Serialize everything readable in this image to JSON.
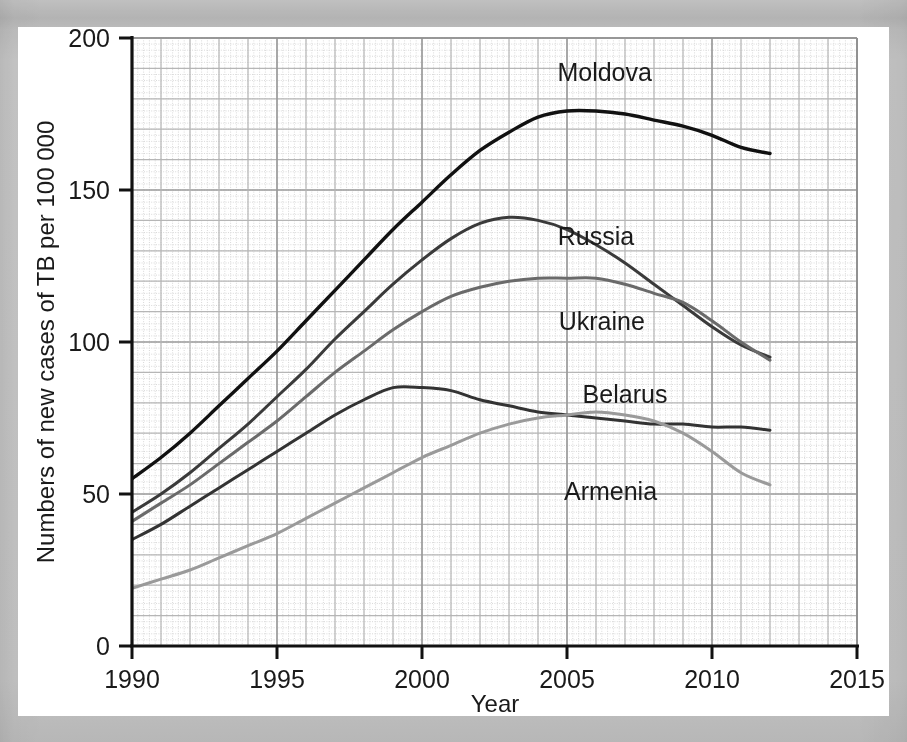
{
  "chart_data": {
    "type": "line",
    "title": "",
    "xlabel": "Year",
    "ylabel": "Numbers of new cases of TB per 100 000",
    "xlim": [
      1990,
      2015
    ],
    "ylim": [
      0,
      200
    ],
    "xticks": [
      1990,
      1995,
      2000,
      2005,
      2010,
      2015
    ],
    "xtick_labels": [
      "1990",
      "1995",
      "2000",
      "2005",
      "2010",
      "2015"
    ],
    "yticks": [
      0,
      50,
      100,
      150,
      200
    ],
    "ytick_labels": [
      "0",
      "50",
      "100",
      "150",
      "200"
    ],
    "grid": true,
    "grid_major_step_x": 1,
    "grid_major_step_y": 10,
    "grid_minor_step_x": 0.2,
    "grid_minor_step_y": 2,
    "legend": "inline-labels",
    "x": [
      1990,
      1991,
      1992,
      1993,
      1994,
      1995,
      1996,
      1997,
      1998,
      1999,
      2000,
      2001,
      2002,
      2003,
      2004,
      2005,
      2006,
      2007,
      2008,
      2009,
      2010,
      2011,
      2012
    ],
    "series": [
      {
        "name": "Moldova",
        "color": "#111111",
        "width": 3.4,
        "label_x": 2006.3,
        "label_y": 186,
        "values": [
          55,
          62,
          70,
          79,
          88,
          97,
          107,
          117,
          127,
          137,
          146,
          155,
          163,
          169,
          174,
          176,
          176,
          175,
          173,
          171,
          168,
          164,
          162
        ]
      },
      {
        "name": "Russia",
        "color": "#3a3a3a",
        "width": 3.0,
        "label_x": 2006.0,
        "label_y": 132,
        "values": [
          44,
          50,
          57,
          65,
          73,
          82,
          91,
          101,
          110,
          119,
          127,
          134,
          139,
          141,
          140,
          137,
          132,
          126,
          119,
          112,
          105,
          99,
          95
        ]
      },
      {
        "name": "Ukraine",
        "color": "#6a6a6a",
        "width": 3.0,
        "label_x": 2006.2,
        "label_y": 104,
        "values": [
          41,
          47,
          53,
          60,
          67,
          74,
          82,
          90,
          97,
          104,
          110,
          115,
          118,
          120,
          121,
          121,
          121,
          119,
          116,
          113,
          107,
          100,
          94
        ]
      },
      {
        "name": "Belarus",
        "color": "#333333",
        "width": 3.0,
        "label_x": 2007.0,
        "label_y": 80,
        "values": [
          35,
          40,
          46,
          52,
          58,
          64,
          70,
          76,
          81,
          85,
          85,
          84,
          81,
          79,
          77,
          76,
          75,
          74,
          73,
          73,
          72,
          72,
          71
        ]
      },
      {
        "name": "Armenia",
        "color": "#9a9a9a",
        "width": 3.0,
        "label_x": 2006.5,
        "label_y": 48,
        "values": [
          19,
          22,
          25,
          29,
          33,
          37,
          42,
          47,
          52,
          57,
          62,
          66,
          70,
          73,
          75,
          76,
          77,
          76,
          74,
          70,
          64,
          57,
          53
        ]
      }
    ]
  },
  "axes": {
    "y_title": "Numbers of new cases of TB per 100 000",
    "x_title": "Year"
  }
}
